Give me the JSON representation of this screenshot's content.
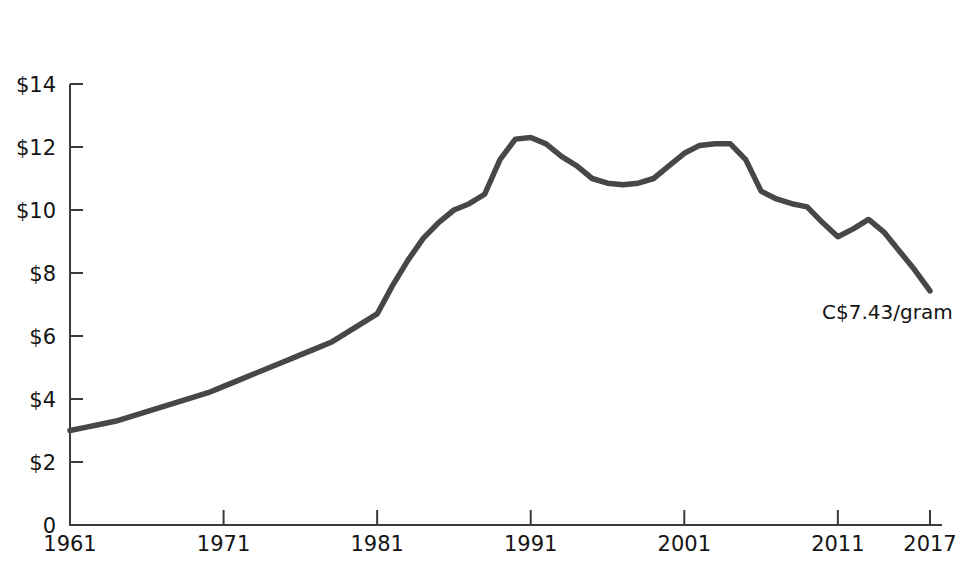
{
  "chart_data": {
    "type": "line",
    "title": "",
    "subtitle": "",
    "xlabel": "",
    "ylabel": "",
    "xlim": [
      1961,
      2017
    ],
    "ylim": [
      0,
      14
    ],
    "grid": false,
    "legend": "none",
    "line_color": "#474747",
    "axis_color": "#3b3b3b",
    "x_tick_labels": [
      "1961",
      "1971",
      "1981",
      "1991",
      "2001",
      "2011",
      "2017"
    ],
    "x_tick_values": [
      1961,
      1971,
      1981,
      1991,
      2001,
      2011,
      2017
    ],
    "y_tick_labels": [
      "0",
      "$2",
      "$4",
      "$6",
      "$8",
      "$10",
      "$12",
      "$14"
    ],
    "y_tick_values": [
      0,
      2,
      4,
      6,
      8,
      10,
      12,
      14
    ],
    "x": [
      1961,
      1962,
      1963,
      1964,
      1965,
      1966,
      1967,
      1968,
      1969,
      1970,
      1971,
      1972,
      1973,
      1974,
      1975,
      1976,
      1977,
      1978,
      1979,
      1980,
      1981,
      1982,
      1983,
      1984,
      1985,
      1986,
      1987,
      1988,
      1989,
      1990,
      1991,
      1992,
      1993,
      1994,
      1995,
      1996,
      1997,
      1998,
      1999,
      2000,
      2001,
      2002,
      2003,
      2004,
      2005,
      2006,
      2007,
      2008,
      2009,
      2010,
      2011,
      2012,
      2013,
      2014,
      2015,
      2016,
      2017
    ],
    "y": [
      3.0,
      3.1,
      3.2,
      3.3,
      3.45,
      3.6,
      3.75,
      3.9,
      4.05,
      4.2,
      4.4,
      4.6,
      4.8,
      5.0,
      5.2,
      5.4,
      5.6,
      5.8,
      6.1,
      6.4,
      6.7,
      7.6,
      8.4,
      9.1,
      9.6,
      10.0,
      10.2,
      10.5,
      11.6,
      12.25,
      12.3,
      12.1,
      11.7,
      11.4,
      11.0,
      10.85,
      10.8,
      10.85,
      11.0,
      11.4,
      11.8,
      12.05,
      12.1,
      12.1,
      11.6,
      10.6,
      10.35,
      10.2,
      10.1,
      9.6,
      9.15,
      9.4,
      9.7,
      9.3,
      8.7,
      8.1,
      7.43
    ],
    "series_name": "Price per gram",
    "annotations": [
      {
        "text": "C$7.43/gram",
        "x": 2017,
        "y": 7.43,
        "label": "end-point-value"
      }
    ]
  },
  "meta": {
    "currency_note": "C$7.43/gram"
  }
}
